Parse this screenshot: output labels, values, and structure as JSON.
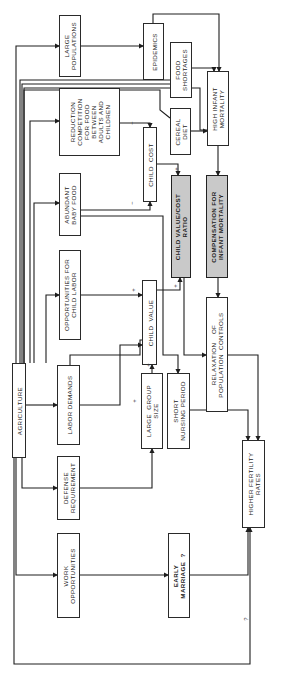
{
  "diagram": {
    "type": "causal-flow-diagram",
    "orientation": "rotated-90-ccw",
    "nodes": [
      {
        "id": "agriculture",
        "label": "AGRICULTURE",
        "x": 12,
        "y": 363,
        "w": 14,
        "h": 95,
        "style": "plain"
      },
      {
        "id": "large_populations",
        "label": "LARGE\nPOPULATIONS",
        "x": 59,
        "y": 15,
        "w": 22,
        "h": 62,
        "style": "plain"
      },
      {
        "id": "reduction_competition",
        "label": "REDUCTION\nCOMPETITION\nFOR FOOD\nBETWEEN\nADULTS AND\nCHILDREN",
        "x": 59,
        "y": 88,
        "w": 61,
        "h": 68,
        "style": "plain"
      },
      {
        "id": "abundant_baby_food",
        "label": "ABUNDANT\nBABY FOOD",
        "x": 59,
        "y": 173,
        "w": 22,
        "h": 63,
        "style": "plain"
      },
      {
        "id": "opportunities_child_labor",
        "label": "OPPORTUNITIES FOR\nCHILD LABOR",
        "x": 59,
        "y": 250,
        "w": 22,
        "h": 90,
        "style": "plain"
      },
      {
        "id": "labor_demands",
        "label": "LABOR DEMANDS",
        "x": 57,
        "y": 365,
        "w": 23,
        "h": 80,
        "style": "plain"
      },
      {
        "id": "defense_requirement",
        "label": "DEFENSE\nREQUIREMENT",
        "x": 57,
        "y": 456,
        "w": 23,
        "h": 64,
        "style": "plain"
      },
      {
        "id": "work_opportunities",
        "label": "WORK\nOPPORTUNITIES",
        "x": 57,
        "y": 533,
        "w": 23,
        "h": 85,
        "style": "plain"
      },
      {
        "id": "epidemics",
        "label": "EPIDEMICS",
        "x": 143,
        "y": 23,
        "w": 21,
        "h": 57,
        "style": "plain"
      },
      {
        "id": "food_shortages",
        "label": "FOOD\nSHORTAGES",
        "x": 170,
        "y": 42,
        "w": 22,
        "h": 56,
        "style": "plain"
      },
      {
        "id": "high_infant_mortality",
        "label": "HIGH INFANT\nMORTALITY",
        "x": 207,
        "y": 71,
        "w": 22,
        "h": 75,
        "style": "plain"
      },
      {
        "id": "cereal_diet",
        "label": "CEREAL\nDIET",
        "x": 170,
        "y": 108,
        "w": 21,
        "h": 47,
        "style": "plain"
      },
      {
        "id": "child_cost",
        "label": "CHILD  COST",
        "x": 143,
        "y": 127,
        "w": 14,
        "h": 75,
        "style": "plain"
      },
      {
        "id": "child_value_cost_ratio",
        "label": "CHILD VALUE/COST\nRATIO",
        "x": 171,
        "y": 175,
        "w": 20,
        "h": 103,
        "style": "shaded-bold"
      },
      {
        "id": "compensation_infant_mortality",
        "label": "COMPENSATION FOR\nINFANT MORTALITY",
        "x": 206,
        "y": 175,
        "w": 22,
        "h": 103,
        "style": "shaded-bold"
      },
      {
        "id": "child_value",
        "label": "CHILD  VALUE",
        "x": 142,
        "y": 280,
        "w": 15,
        "h": 85,
        "style": "plain"
      },
      {
        "id": "large_group_size",
        "label": "LARGE  GROUP\nSIZE",
        "x": 141,
        "y": 373,
        "w": 22,
        "h": 76,
        "style": "plain"
      },
      {
        "id": "short_nursing_period",
        "label": "SHORT\nNURSING PERIOD",
        "x": 167,
        "y": 373,
        "w": 23,
        "h": 76,
        "style": "plain"
      },
      {
        "id": "relaxation_population_controls",
        "label": "RELAXATION    OF\nPOPULATION  CONTROLS",
        "x": 206,
        "y": 297,
        "w": 22,
        "h": 115,
        "style": "plain"
      },
      {
        "id": "higher_fertility_rates",
        "label": "HIGHER FERTILITY\nRATES",
        "x": 242,
        "y": 440,
        "w": 23,
        "h": 88,
        "style": "plain"
      },
      {
        "id": "early_marriage",
        "label": "EARLY\nMARRIAGE  ?",
        "x": 168,
        "y": 533,
        "w": 22,
        "h": 85,
        "style": "bold"
      }
    ],
    "edge_signs": [
      {
        "text": "−",
        "x": 130,
        "y": 123,
        "note": "reduction competition -> child cost"
      },
      {
        "text": "−",
        "x": 130,
        "y": 203,
        "note": "abundant baby food -> child cost"
      },
      {
        "text": "+",
        "x": 131,
        "y": 290,
        "note": "opportunities child labor -> child value"
      },
      {
        "text": "+",
        "x": 142,
        "y": 345,
        "note": "labor demands -> child value"
      },
      {
        "text": "+",
        "x": 146,
        "y": 363,
        "note": "large group size -> child value"
      },
      {
        "text": "+",
        "x": 174,
        "y": 168,
        "note": "child cost -> ratio"
      },
      {
        "text": "+",
        "x": 173,
        "y": 285,
        "note": "child value -> ratio"
      },
      {
        "text": "?",
        "x": 245,
        "y": 618,
        "note": "agriculture -> higher fertility rates"
      }
    ],
    "edges": [
      [
        "agriculture",
        "large_populations"
      ],
      [
        "agriculture",
        "food_shortages"
      ],
      [
        "agriculture",
        "cereal_diet"
      ],
      [
        "agriculture",
        "reduction_competition"
      ],
      [
        "agriculture",
        "abundant_baby_food"
      ],
      [
        "agriculture",
        "opportunities_child_labor"
      ],
      [
        "agriculture",
        "labor_demands"
      ],
      [
        "agriculture",
        "defense_requirement"
      ],
      [
        "agriculture",
        "work_opportunities"
      ],
      [
        "agriculture",
        "higher_fertility_rates"
      ],
      [
        "large_populations",
        "epidemics"
      ],
      [
        "epidemics",
        "high_infant_mortality"
      ],
      [
        "food_shortages",
        "high_infant_mortality"
      ],
      [
        "cereal_diet",
        "high_infant_mortality"
      ],
      [
        "high_infant_mortality",
        "compensation_infant_mortality"
      ],
      [
        "compensation_infant_mortality",
        "relaxation_population_controls"
      ],
      [
        "reduction_competition",
        "child_cost"
      ],
      [
        "abundant_baby_food",
        "child_cost"
      ],
      [
        "abundant_baby_food",
        "short_nursing_period"
      ],
      [
        "child_cost",
        "child_value_cost_ratio"
      ],
      [
        "opportunities_child_labor",
        "child_value"
      ],
      [
        "labor_demands",
        "child_value"
      ],
      [
        "labor_demands",
        "child_value_cost_ratio"
      ],
      [
        "defense_requirement",
        "large_group_size"
      ],
      [
        "large_group_size",
        "child_value"
      ],
      [
        "child_value",
        "child_value_cost_ratio"
      ],
      [
        "child_value_cost_ratio",
        "relaxation_population_controls"
      ],
      [
        "relaxation_population_controls",
        "higher_fertility_rates"
      ],
      [
        "short_nursing_period",
        "higher_fertility_rates"
      ],
      [
        "work_opportunities",
        "early_marriage"
      ],
      [
        "early_marriage",
        "higher_fertility_rates"
      ]
    ]
  }
}
